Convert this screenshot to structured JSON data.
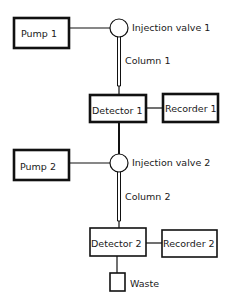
{
  "diagram": {
    "type": "flow-schematic",
    "stage1": {
      "pump": "Pump 1",
      "valve": "Injection valve 1",
      "column": "Column 1",
      "detector": "Detector 1",
      "recorder": "Recorder 1"
    },
    "stage2": {
      "pump": "Pump 2",
      "valve": "Injection valve 2",
      "column": "Column 2",
      "detector": "Detector 2",
      "recorder": "Recorder 2"
    },
    "waste": "Waste",
    "connections": [
      [
        "Pump 1",
        "Injection valve 1"
      ],
      [
        "Injection valve 1",
        "Column 1"
      ],
      [
        "Column 1",
        "Detector 1"
      ],
      [
        "Detector 1",
        "Recorder 1"
      ],
      [
        "Detector 1",
        "Injection valve 2"
      ],
      [
        "Pump 2",
        "Injection valve 2"
      ],
      [
        "Injection valve 2",
        "Column 2"
      ],
      [
        "Column 2",
        "Detector 2"
      ],
      [
        "Detector 2",
        "Recorder 2"
      ],
      [
        "Detector 2",
        "Waste"
      ]
    ]
  }
}
